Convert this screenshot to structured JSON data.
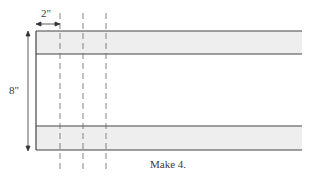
{
  "diagram": {
    "dimensions": {
      "width_label": "2\"",
      "height_label": "8\""
    },
    "caption": "Make 4.",
    "colors": {
      "band_fill": "#eeeeee",
      "line": "#444444",
      "dashed": "#666666",
      "background": "#ffffff"
    },
    "bands": [
      {
        "name": "top-band",
        "y": 31,
        "height": 23
      },
      {
        "name": "bottom-band",
        "y": 126,
        "height": 24
      }
    ],
    "cut_lines_x": [
      60,
      83,
      106
    ]
  }
}
